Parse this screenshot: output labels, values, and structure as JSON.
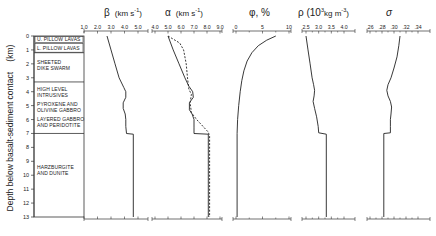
{
  "chart_data": {
    "type": "line",
    "title": "",
    "ylabel": "Depth below basalt-sediment contact (km)",
    "y": {
      "range": [
        0,
        13
      ],
      "ticks": [
        "0",
        "1",
        "2",
        "3",
        "4",
        "5",
        "6",
        "7",
        "8",
        "9",
        "10",
        "11",
        "12",
        "13"
      ],
      "inverted": true
    },
    "lithology": [
      {
        "label": "U. PILLOW LAVAS",
        "top": 0.0,
        "bottom": 0.5
      },
      {
        "label": "L. PILLOW LAVAS",
        "top": 0.5,
        "bottom": 1.2
      },
      {
        "label": "SHEETED DIKE SWARM",
        "top": 1.2,
        "bottom": 3.3
      },
      {
        "label": "HIGH LEVEL INTRUSIVES",
        "top": 3.3,
        "bottom": 4.6
      },
      {
        "label": "PYROXENE AND OLIVINE GABBRO",
        "top": 4.6,
        "bottom": 5.6
      },
      {
        "label": "LAYERED GABBRO AND PERIDOTITE",
        "top": 5.6,
        "bottom": 7.0
      },
      {
        "label": "HARZBURGITE AND DUNITE",
        "top": 7.0,
        "bottom": 13.0
      }
    ],
    "panels": [
      {
        "name": "beta",
        "title": "β  (km s⁻¹)",
        "xticks": [
          "1.0",
          "2.0",
          "3.0",
          "4.0",
          "5.0"
        ],
        "xlim": [
          1.0,
          5.0
        ],
        "series": [
          {
            "name": "β",
            "style": "solid",
            "depth": [
              0,
              1,
              2,
              3,
              3.7,
              4.0,
              4.4,
              4.8,
              5.2,
              5.6,
              6.0,
              6.5,
              7.0,
              7.05,
              13
            ],
            "values": [
              2.7,
              3.0,
              3.3,
              3.6,
              3.95,
              4.1,
              4.1,
              3.9,
              3.9,
              4.05,
              4.1,
              4.1,
              4.15,
              4.65,
              4.65
            ]
          }
        ]
      },
      {
        "name": "alpha",
        "title": "α  (km s⁻¹)",
        "xticks": [
          "4.0",
          "5.0",
          "6.0",
          "7.0",
          "8.0",
          "9.0"
        ],
        "xlim": [
          4.0,
          9.0
        ],
        "series": [
          {
            "name": "α (solid)",
            "style": "solid",
            "depth": [
              0,
              1,
              2,
              3,
              3.6,
              4.0,
              4.4,
              4.8,
              5.3,
              5.6,
              6.0,
              6.6,
              7.0,
              7.05,
              13
            ],
            "values": [
              5.0,
              5.4,
              5.85,
              6.3,
              6.6,
              6.9,
              6.95,
              6.65,
              6.65,
              6.85,
              7.0,
              7.0,
              7.0,
              8.1,
              8.1
            ]
          },
          {
            "name": "α (dashed)",
            "style": "dashed",
            "depth": [
              0,
              0.5,
              1.0,
              2.0,
              3.0,
              3.8,
              4.2,
              4.8,
              5.5,
              6.0,
              6.6,
              6.9,
              7.2,
              13
            ],
            "values": [
              5.0,
              5.9,
              6.2,
              6.4,
              6.5,
              6.6,
              6.8,
              6.7,
              6.8,
              7.2,
              7.8,
              8.1,
              8.2,
              8.2
            ]
          }
        ]
      },
      {
        "name": "phi",
        "title": "φ, %",
        "xticks": [
          "0",
          "5",
          "10"
        ],
        "xlim": [
          0,
          10
        ],
        "series": [
          {
            "name": "φ",
            "style": "solid",
            "depth": [
              0,
              0.3,
              0.7,
              1.2,
              1.8,
              2.5,
              3.2,
              4.0,
              5.0,
              6.0,
              7.0,
              13
            ],
            "values": [
              7.5,
              5.8,
              4.2,
              3.0,
              2.1,
              1.5,
              1.1,
              0.8,
              0.5,
              0.3,
              0.2,
              0.2
            ]
          }
        ]
      },
      {
        "name": "rho",
        "title": "ρ (10³kg m⁻³)",
        "xticks": [
          "2.5",
          "3.0",
          "3.5",
          "4.0"
        ],
        "xlim": [
          2.5,
          4.0
        ],
        "series": [
          {
            "name": "ρ",
            "style": "solid",
            "depth": [
              0,
              1,
              2,
              3,
              3.5,
              3.9,
              4.3,
              4.7,
              5.2,
              5.8,
              6.5,
              6.95,
              7.05,
              13
            ],
            "values": [
              2.5,
              2.58,
              2.66,
              2.74,
              2.8,
              2.84,
              2.82,
              2.78,
              2.84,
              2.92,
              2.98,
              3.0,
              3.3,
              3.3
            ]
          }
        ]
      },
      {
        "name": "sigma",
        "title": "σ",
        "xticks": [
          ".26",
          ".28",
          ".30",
          ".32",
          ".34"
        ],
        "xlim": [
          0.26,
          0.34
        ],
        "series": [
          {
            "name": "σ",
            "style": "solid",
            "depth": [
              0,
              0.7,
              1.5,
              2.3,
              3.0,
              3.5,
              3.9,
              4.3,
              4.7,
              5.1,
              5.6,
              6.0,
              6.5,
              6.95,
              7.0,
              13
            ],
            "values": [
              0.31,
              0.308,
              0.305,
              0.3,
              0.295,
              0.29,
              0.288,
              0.29,
              0.294,
              0.296,
              0.295,
              0.294,
              0.294,
              0.294,
              0.283,
              0.283
            ]
          }
        ]
      }
    ],
    "grid": false,
    "legend": null
  },
  "labels": {
    "beta_title": "β",
    "beta_units": "(km s",
    "beta_exp": "-1",
    "alpha_title": "α",
    "alpha_units": "(km s",
    "alpha_exp": "-1",
    "phi_title": "φ, %",
    "rho_title": "ρ (10",
    "rho_sup": "3",
    "rho_units": "kg m",
    "rho_exp": "-3",
    "sigma_title": "σ",
    "ylabel": "Depth below basalt-sediment contact",
    "ylabel_units": "(km)"
  }
}
